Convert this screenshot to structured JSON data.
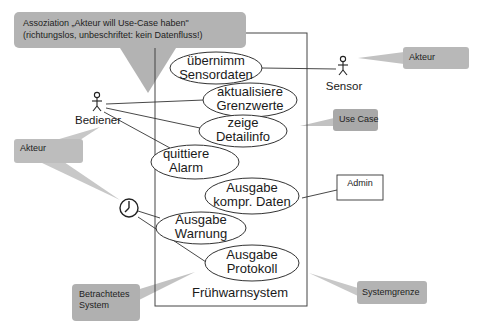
{
  "diagram": {
    "type": "uml-use-case",
    "system": {
      "name": "Frühwarnsystem"
    },
    "use_cases": [
      {
        "id": "uc1",
        "line1": "übernimm",
        "line2": "Sensordaten"
      },
      {
        "id": "uc2",
        "line1": "aktualisiere",
        "line2": "Grenzwerte"
      },
      {
        "id": "uc3",
        "line1": "zeige",
        "line2": "Detailinfo"
      },
      {
        "id": "uc4",
        "line1": "quittiere",
        "line2": "Alarm"
      },
      {
        "id": "uc5",
        "line1": "Ausgabe",
        "line2": "kompr. Daten"
      },
      {
        "id": "uc6",
        "line1": "Ausgabe",
        "line2": "Warnung"
      },
      {
        "id": "uc7",
        "line1": "Ausgabe",
        "line2": "Protokoll"
      }
    ],
    "actors": [
      {
        "id": "sensor",
        "label": "Sensor",
        "icon": "stick-figure-icon"
      },
      {
        "id": "bediener",
        "label": "Bediener",
        "icon": "stick-figure-icon"
      },
      {
        "id": "timer",
        "label": "",
        "icon": "clock-icon"
      },
      {
        "id": "admin",
        "label": "Admin",
        "icon": "box"
      }
    ],
    "associations": [
      [
        "sensor",
        "uc1"
      ],
      [
        "bediener",
        "uc2"
      ],
      [
        "bediener",
        "uc3"
      ],
      [
        "bediener",
        "uc4"
      ],
      [
        "timer",
        "uc6"
      ],
      [
        "timer",
        "uc7"
      ],
      [
        "admin",
        "uc5"
      ]
    ],
    "callouts": {
      "association_line1": "Assoziation „Akteur will Use-Case haben\"",
      "association_line2": "(richtungslos, unbeschriftet: kein Datenfluss!)",
      "akteur_right": "Akteur",
      "use_case": "Use Case",
      "akteur_left": "Akteur",
      "betrachtetes_line1": "Betrachtetes",
      "betrachtetes_line2": "System",
      "systemgrenze": "Systemgrenze"
    },
    "colors": {
      "callout_fill": "#b3b3b3",
      "line": "#333333",
      "background": "#ffffff"
    }
  }
}
